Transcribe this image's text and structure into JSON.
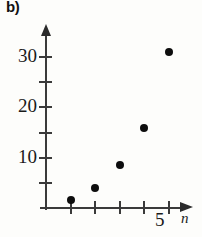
{
  "panel": {
    "label": "b)"
  },
  "chart_data": {
    "type": "scatter",
    "title": "",
    "subtitle": "",
    "xlabel": "n",
    "ylabel": "",
    "x": [
      1,
      2,
      3,
      4,
      5
    ],
    "values": [
      1.5,
      4,
      8.5,
      16,
      31
    ],
    "points": [
      {
        "x": 1,
        "y": 1.5
      },
      {
        "x": 2,
        "y": 4
      },
      {
        "x": 3,
        "y": 8.5
      },
      {
        "x": 4,
        "y": 16
      },
      {
        "x": 5,
        "y": 31
      }
    ],
    "xlim": [
      0,
      5.8
    ],
    "ylim": [
      0,
      35
    ],
    "x_ticks": [
      1,
      2,
      3,
      4,
      5
    ],
    "x_tick_labels": [
      "",
      "",
      "",
      "",
      "5"
    ],
    "y_ticks": [
      5,
      10,
      15,
      20,
      25,
      30
    ],
    "y_tick_labels": [
      "",
      "10",
      "",
      "20",
      "",
      "30"
    ],
    "grid": false,
    "legend": null,
    "marker_color": "#0d0d0d",
    "axis_color": "#3a3a3a"
  },
  "axes": {
    "y_labels": [
      {
        "text": "30",
        "value": 30
      },
      {
        "text": "20",
        "value": 20
      },
      {
        "text": "10",
        "value": 10
      }
    ],
    "x_labels": [
      {
        "text": "5",
        "value": 5
      }
    ],
    "x_axis_name": "n"
  }
}
